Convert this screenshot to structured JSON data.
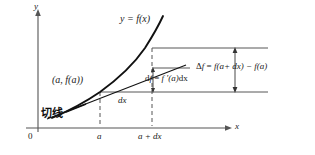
{
  "figure": {
    "type": "calculus-differential-diagram",
    "colors": {
      "curve": "#111111",
      "axis": "#555555",
      "guide": "#444444",
      "dashed": "#555555",
      "text": "#1a1a1a"
    },
    "axes": {
      "y_label": "y",
      "x_label": "x",
      "origin_label": "0"
    },
    "ticks": {
      "a": "a",
      "a_plus_dx": "a + dx"
    },
    "labels": {
      "function_curve": "y = f(x)",
      "point": "(a, f(a))",
      "tangent_cjk": "切线",
      "delta_x": "dx",
      "differential": "df = f ′(a)dx",
      "increment": "Δf = f(a+ dx) − f(a)"
    },
    "parts": {
      "differential_lhs": "d",
      "differential_f": "f",
      "differential_eq": " = ",
      "differential_fprime": "f ′",
      "differential_arg": "(a)",
      "differential_dx": "dx",
      "increment_delta": "Δ",
      "increment_f": "f",
      "increment_eq": " = ",
      "increment_body": "f(a+ dx) − f(a)"
    },
    "geometry": {
      "x_axis_y": 128,
      "y_axis_x": 38,
      "a_x": 100,
      "a_dx_x": 152,
      "f_a_y": 92,
      "f_a_dx_y": 48,
      "tangent_y": 68,
      "delta_arrow_x": 235,
      "df_arrow_x": 153
    }
  }
}
